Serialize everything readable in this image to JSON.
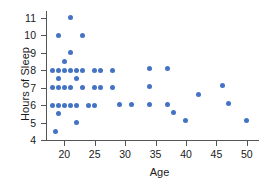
{
  "chart_data": {
    "type": "scatter",
    "title": "",
    "xlabel": "Age",
    "ylabel": "Hours of Sleep",
    "xlim": [
      17,
      52
    ],
    "ylim": [
      4,
      11.4
    ],
    "grid": false,
    "legend": null,
    "marker_color": "#4472c4",
    "xticks": [
      20,
      25,
      30,
      35,
      40,
      45,
      50
    ],
    "yticks": [
      4,
      5,
      6,
      7,
      8,
      9,
      10,
      11
    ],
    "points": [
      {
        "x": 21,
        "y": 11
      },
      {
        "x": 19,
        "y": 10
      },
      {
        "x": 23,
        "y": 10
      },
      {
        "x": 21,
        "y": 9
      },
      {
        "x": 20,
        "y": 8.5
      },
      {
        "x": 18,
        "y": 8
      },
      {
        "x": 19,
        "y": 8
      },
      {
        "x": 20,
        "y": 8
      },
      {
        "x": 21,
        "y": 8
      },
      {
        "x": 22,
        "y": 8
      },
      {
        "x": 23,
        "y": 8
      },
      {
        "x": 25,
        "y": 8
      },
      {
        "x": 26,
        "y": 8
      },
      {
        "x": 28,
        "y": 8
      },
      {
        "x": 34,
        "y": 8.1
      },
      {
        "x": 37,
        "y": 8.1
      },
      {
        "x": 19,
        "y": 7.5
      },
      {
        "x": 22,
        "y": 7.5
      },
      {
        "x": 18,
        "y": 7
      },
      {
        "x": 19,
        "y": 7
      },
      {
        "x": 20,
        "y": 7
      },
      {
        "x": 21,
        "y": 7
      },
      {
        "x": 23,
        "y": 7
      },
      {
        "x": 25,
        "y": 7
      },
      {
        "x": 26,
        "y": 7
      },
      {
        "x": 28,
        "y": 7
      },
      {
        "x": 34,
        "y": 7.05
      },
      {
        "x": 46,
        "y": 7.1
      },
      {
        "x": 42,
        "y": 6.6
      },
      {
        "x": 18,
        "y": 6
      },
      {
        "x": 19,
        "y": 6
      },
      {
        "x": 20,
        "y": 6
      },
      {
        "x": 21,
        "y": 6
      },
      {
        "x": 22,
        "y": 6
      },
      {
        "x": 24,
        "y": 6
      },
      {
        "x": 25,
        "y": 6
      },
      {
        "x": 29,
        "y": 6.05
      },
      {
        "x": 31,
        "y": 6.05
      },
      {
        "x": 34,
        "y": 6.05
      },
      {
        "x": 37,
        "y": 6.05
      },
      {
        "x": 47,
        "y": 6.1
      },
      {
        "x": 19,
        "y": 5.5
      },
      {
        "x": 38,
        "y": 5.6
      },
      {
        "x": 22,
        "y": 5
      },
      {
        "x": 40,
        "y": 5.1
      },
      {
        "x": 50,
        "y": 5.1
      },
      {
        "x": 18.5,
        "y": 4.5
      }
    ]
  }
}
